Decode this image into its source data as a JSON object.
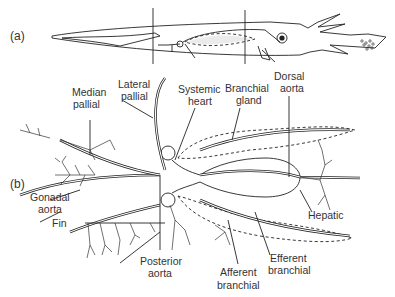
{
  "figure": {
    "panels": [
      {
        "id": "a",
        "label": "(a)",
        "subject": "squid-whole-body-outline"
      },
      {
        "id": "b",
        "label": "(b)",
        "subject": "circulatory-system-detail"
      }
    ],
    "labels": {
      "median_pallial": [
        "Median",
        "pallial"
      ],
      "lateral_pallial": [
        "Lateral",
        "pallial"
      ],
      "systemic_heart": [
        "Systemic",
        "heart"
      ],
      "branchial_gland": [
        "Branchial",
        "gland"
      ],
      "dorsal_aorta": [
        "Dorsal",
        "aorta"
      ],
      "gonadal_aorta": [
        "Gonadal",
        "aorta"
      ],
      "fin": [
        "Fin"
      ],
      "posterior_aorta": [
        "Posterior",
        "aorta"
      ],
      "hepatic": [
        "Hepatic"
      ],
      "afferent_branchial": [
        "Afferent",
        "branchial"
      ],
      "efferent_branchial": [
        "Efferent",
        "branchial"
      ]
    }
  }
}
